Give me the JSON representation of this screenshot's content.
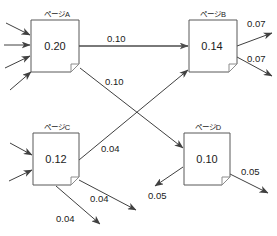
{
  "diagram": {
    "type": "pagerank-flow-graph",
    "width": 277,
    "height": 236,
    "background": "#ffffff",
    "stroke_color": "#404040",
    "box_stroke_color": "#595959",
    "text_color": "#1a1a1a",
    "nodes": [
      {
        "id": "A",
        "title": "ページA",
        "value": "0.20",
        "x": 31,
        "y": 20,
        "w": 48,
        "h": 52
      },
      {
        "id": "B",
        "title": "ページB",
        "value": "0.14",
        "x": 189,
        "y": 20,
        "w": 48,
        "h": 52
      },
      {
        "id": "C",
        "title": "ページC",
        "value": "0.12",
        "x": 33,
        "y": 133,
        "w": 46,
        "h": 52
      },
      {
        "id": "D",
        "title": "ページD",
        "value": "0.10",
        "x": 184,
        "y": 133,
        "w": 46,
        "h": 52
      }
    ],
    "edges": [
      {
        "id": "a-to-b",
        "from": "A",
        "to": "B",
        "label": "0.10",
        "lx": 107,
        "ly": 42
      },
      {
        "id": "a-to-d",
        "from": "A",
        "to": "D",
        "label": "0.10",
        "lx": 105,
        "ly": 85
      },
      {
        "id": "c-to-b",
        "from": "C",
        "to": "B",
        "label": "0.04",
        "lx": 101,
        "ly": 152
      },
      {
        "id": "b-out-1",
        "from": "B",
        "to": "external",
        "label": "0.07",
        "lx": 247,
        "ly": 27
      },
      {
        "id": "b-out-2",
        "from": "B",
        "to": "external",
        "label": "0.07",
        "lx": 247,
        "ly": 60
      },
      {
        "id": "c-out-1",
        "from": "C",
        "to": "external",
        "label": "0.04",
        "lx": 90,
        "ly": 200
      },
      {
        "id": "c-out-2",
        "from": "C",
        "to": "external",
        "label": "0.04",
        "lx": 56,
        "ly": 217
      },
      {
        "id": "d-out-left",
        "from": "D",
        "to": "external",
        "label": "0.05",
        "lx": 150,
        "ly": 198
      },
      {
        "id": "d-out-right",
        "from": "D",
        "to": "external",
        "label": "0.05",
        "lx": 243,
        "ly": 175
      }
    ],
    "incoming_arrows": {
      "A": 4,
      "C": 2
    }
  }
}
